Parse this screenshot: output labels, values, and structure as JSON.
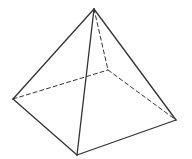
{
  "diagram": {
    "title": "",
    "type": "square pyramid wireframe",
    "stroke_color": "#333333",
    "background": "#ffffff",
    "vertices": {
      "apex": [
        94,
        9
      ],
      "left": [
        13,
        99
      ],
      "front": [
        77,
        155
      ],
      "right": [
        176,
        120
      ],
      "back": [
        108,
        70
      ]
    },
    "visible_edges": [
      [
        "apex",
        "left"
      ],
      [
        "apex",
        "front"
      ],
      [
        "apex",
        "right"
      ],
      [
        "left",
        "front"
      ],
      [
        "front",
        "right"
      ]
    ],
    "hidden_edges": [
      [
        "apex",
        "back"
      ],
      [
        "left",
        "back"
      ],
      [
        "back",
        "right"
      ]
    ]
  }
}
